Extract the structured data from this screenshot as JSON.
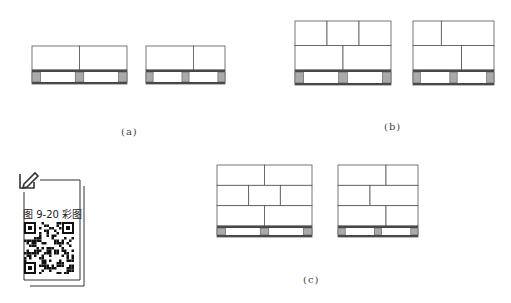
{
  "figure": {
    "captions": {
      "a": "(a)",
      "b": "(b)",
      "c": "(c)"
    },
    "qr_label": "图 9-20 彩图",
    "colors": {
      "line": "#555555",
      "block_fill": "#aaaaaa",
      "deck": "#444444"
    },
    "panels": [
      {
        "id": "a-left",
        "group": "a",
        "layers": [
          [
            1,
            1
          ]
        ],
        "blocks": 3
      },
      {
        "id": "a-right",
        "group": "a",
        "layers": [
          [
            0.6,
            0.4
          ]
        ],
        "blocks": 3
      },
      {
        "id": "b-left",
        "group": "b",
        "layers": [
          [
            1,
            1,
            1
          ],
          [
            1,
            1
          ]
        ],
        "blocks": 3
      },
      {
        "id": "b-right",
        "group": "b",
        "layers": [
          [
            0.35,
            0.65
          ],
          [
            0.6,
            0.4
          ]
        ],
        "blocks": 3
      },
      {
        "id": "c-left",
        "group": "c",
        "layers": [
          [
            1,
            1
          ],
          [
            1,
            1,
            1
          ],
          [
            1,
            1
          ]
        ],
        "blocks": 3
      },
      {
        "id": "c-right",
        "group": "c",
        "layers": [
          [
            0.6,
            0.4
          ],
          [
            0.4,
            0.6
          ],
          [
            0.6,
            0.4
          ]
        ],
        "blocks": 3
      }
    ]
  }
}
